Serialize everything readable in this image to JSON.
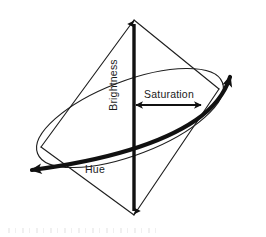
{
  "figure": {
    "background_color": "#ffffff",
    "stroke_color": "#1f1f1f",
    "labels": {
      "brightness": "Brightness",
      "saturation": "Saturation",
      "hue": "Hue"
    },
    "axes": {
      "brightness": {
        "name": "brightness-axis",
        "orientation": "vertical",
        "arrow_heads": "both",
        "top_point": [
          134,
          17
        ],
        "bottom_point": [
          134,
          217
        ]
      },
      "saturation": {
        "name": "saturation-axis",
        "orientation": "horizontal",
        "arrow_heads": "both",
        "left_point": [
          131,
          105
        ],
        "right_point": [
          206,
          105
        ]
      },
      "hue": {
        "name": "hue-arc",
        "orientation": "curved",
        "arrow_heads": "both",
        "left_point": [
          25,
          172
        ],
        "right_point": [
          232,
          70
        ]
      }
    },
    "shapes": {
      "cone_apex_top": [
        134,
        20
      ],
      "cone_apex_bottom": [
        134,
        215
      ],
      "rim_ellipse_center": [
        130,
        118
      ],
      "rim_ellipse_rx": 99,
      "rim_ellipse_ry": 37,
      "rim_ellipse_rotation_deg": -21
    }
  }
}
